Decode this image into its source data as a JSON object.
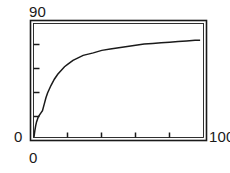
{
  "figure": {
    "background_color": "#ffffff",
    "frame_color": "#1a1a1a",
    "curve_color": "#1a1a1a"
  },
  "labels": {
    "y_max": "90",
    "y_min": "0",
    "x_min": "0",
    "x_max": "100"
  },
  "chart_data": {
    "type": "line",
    "title": "",
    "subtitle": "",
    "xlabel": "",
    "ylabel": "",
    "xlim": [
      0,
      100
    ],
    "ylim": [
      0,
      90
    ],
    "xticks": [
      0,
      20,
      40,
      60,
      80,
      100
    ],
    "yticks": [
      0,
      18,
      36,
      54,
      72,
      90
    ],
    "xticklabels": [
      "0",
      "",
      "",
      "",
      "",
      "100"
    ],
    "yticklabels": [
      "0",
      "",
      "",
      "",
      "",
      "90"
    ],
    "tick_direction": "in",
    "grid": false,
    "legend": null,
    "annotations": [],
    "frame": "box",
    "series": [
      {
        "name": "saturating curve",
        "style": "stepped-line",
        "x": [
          0,
          0.5,
          1,
          1.5,
          2,
          2.5,
          3,
          3.5,
          4,
          5,
          6,
          7,
          8,
          9,
          10,
          12,
          14,
          16,
          18,
          20,
          23,
          26,
          29,
          32,
          35,
          40,
          45,
          50,
          55,
          60,
          65,
          70,
          75,
          80,
          85,
          90,
          95,
          98
        ],
        "y": [
          0,
          5,
          9,
          12,
          14,
          16,
          17,
          18,
          19,
          21,
          26,
          31,
          35,
          38,
          41,
          46,
          50,
          53,
          56,
          58,
          61,
          63,
          65,
          66,
          67,
          69,
          70,
          71,
          72,
          73,
          74,
          74.5,
          75,
          75.5,
          76,
          76.5,
          77,
          77
        ]
      }
    ]
  }
}
